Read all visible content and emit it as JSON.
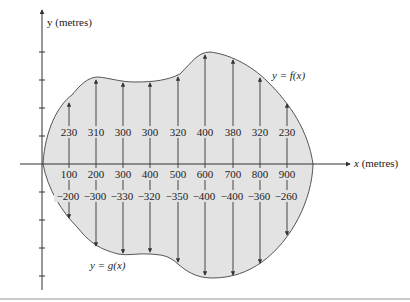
{
  "figure": {
    "y_axis_label": "y (metres)",
    "x_axis_label": "x (metres)",
    "upper_curve_label": "y = f(x)",
    "lower_curve_label": "y = g(x)",
    "fill_color": "#e3e3e3",
    "line_color": "#555555"
  },
  "chart_data": {
    "type": "table",
    "title": "",
    "xlabel": "x (metres)",
    "ylabel": "y (metres)",
    "x": [
      100,
      200,
      300,
      400,
      500,
      600,
      700,
      800,
      900
    ],
    "series": [
      {
        "name": "f(x)",
        "values": [
          230,
          310,
          300,
          300,
          320,
          400,
          380,
          320,
          230
        ]
      },
      {
        "name": "g(x)",
        "values": [
          -200,
          -300,
          -330,
          -320,
          -350,
          -400,
          -400,
          -360,
          -260
        ]
      }
    ]
  },
  "columns": [
    {
      "x": "100",
      "top": "230",
      "bottom": "−200"
    },
    {
      "x": "200",
      "top": "310",
      "bottom": "−300"
    },
    {
      "x": "300",
      "top": "300",
      "bottom": "−330"
    },
    {
      "x": "400",
      "top": "300",
      "bottom": "−320"
    },
    {
      "x": "500",
      "top": "320",
      "bottom": "−350"
    },
    {
      "x": "600",
      "top": "400",
      "bottom": "−400"
    },
    {
      "x": "700",
      "top": "380",
      "bottom": "−400"
    },
    {
      "x": "800",
      "top": "320",
      "bottom": "−360"
    },
    {
      "x": "900",
      "top": "230",
      "bottom": "−260"
    }
  ]
}
